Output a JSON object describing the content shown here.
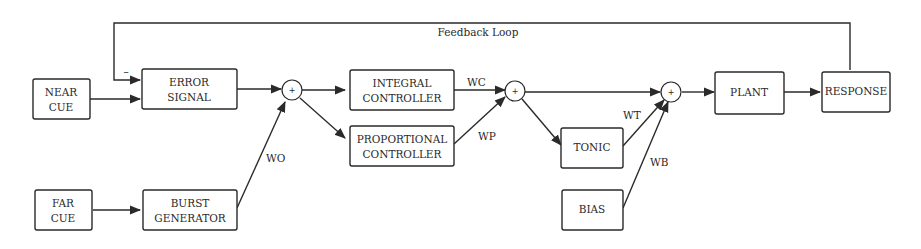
{
  "diagram": {
    "feedback_label": "Feedback Loop",
    "minus_sign": "–",
    "blocks": {
      "near_cue": [
        "NEAR",
        "CUE"
      ],
      "far_cue": [
        "FAR",
        "CUE"
      ],
      "error_signal": [
        "ERROR",
        "SIGNAL"
      ],
      "burst_generator": [
        "BURST",
        "GENERATOR"
      ],
      "integral_controller": [
        "INTEGRAL",
        "CONTROLLER"
      ],
      "proportional_controller": [
        "PROPORTIONAL",
        "CONTROLLER"
      ],
      "tonic": [
        "TONIC"
      ],
      "bias": [
        "BIAS"
      ],
      "plant": [
        "PLANT"
      ],
      "response": [
        "RESPONSE"
      ]
    },
    "weights": {
      "wo": "WO",
      "wc": "WC",
      "wp": "WP",
      "wt": "WT",
      "wb": "WB"
    },
    "summing_symbol": "+"
  }
}
